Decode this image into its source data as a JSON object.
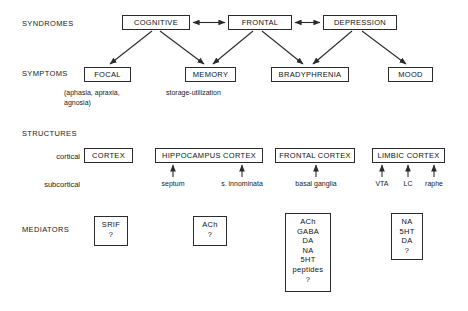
{
  "diagram": {
    "row_labels": {
      "syndromes": "SYNDROMES",
      "symptoms": "SYMPTOMS",
      "structures": "STRUCTURES",
      "mediators": "MEDIATORS"
    },
    "side_labels": {
      "cortical": "cortical",
      "subcortical": "subcortical"
    },
    "syndromes": [
      {
        "id": "cognitive",
        "label": "COGNITIVE"
      },
      {
        "id": "frontal",
        "label": "FRONTAL"
      },
      {
        "id": "depression",
        "label": "DEPRESSION"
      }
    ],
    "symptoms": [
      {
        "id": "focal",
        "label": "FOCAL",
        "caption_line1": "(aphasia, apraxia,",
        "caption_line2": "agnosia)"
      },
      {
        "id": "memory",
        "label": "MEMORY",
        "caption_line1": "storage-utilization",
        "caption_line2": ""
      },
      {
        "id": "bradyphrenia",
        "label": "BRADYPHRENIA",
        "caption_line1": "",
        "caption_line2": ""
      },
      {
        "id": "mood",
        "label": "MOOD",
        "caption_line1": "",
        "caption_line2": ""
      }
    ],
    "structures": [
      {
        "id": "cortex",
        "label": "CORTEX",
        "subcortical": []
      },
      {
        "id": "hippocampus-cortex",
        "label": "HIPPOCAMPUS CORTEX",
        "subcortical": [
          "septum",
          "s. innominata"
        ]
      },
      {
        "id": "frontal-cortex",
        "label": "FRONTAL CORTEX",
        "subcortical": [
          "basal ganglia"
        ]
      },
      {
        "id": "limbic-cortex",
        "label": "LIMBIC CORTEX",
        "subcortical": [
          "VTA",
          "LC",
          "raphe"
        ]
      }
    ],
    "mediators": [
      {
        "id": "srif",
        "items": [
          "SRIF",
          "?"
        ]
      },
      {
        "id": "ach",
        "items": [
          "ACh",
          "?"
        ]
      },
      {
        "id": "basal-ganglia-mediators",
        "items": [
          "ACh",
          "GABA",
          "DA",
          "NA",
          "5HT",
          "peptides",
          "?"
        ]
      },
      {
        "id": "monoamines",
        "items": [
          "NA",
          "5HT",
          "DA",
          "?"
        ]
      }
    ]
  },
  "colors": {
    "stroke": "#2b2b2b",
    "text": "#111111",
    "background": "#ffffff"
  }
}
